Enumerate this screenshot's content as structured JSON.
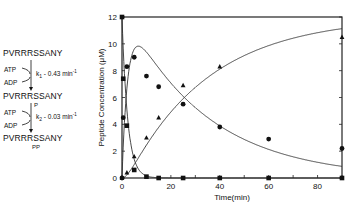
{
  "scheme": {
    "species": [
      {
        "name": "PVRRRSSANY",
        "sub": ""
      },
      {
        "name": "PVRRRSSANY",
        "sub": "P"
      },
      {
        "name": "PVRRRSSANY",
        "sub": "PP"
      }
    ],
    "steps": [
      {
        "in": "ATP",
        "out": "ADP",
        "k": "k",
        "k_sub": "1",
        "rate": " - 0.43 min",
        "unit_sup": "-1"
      },
      {
        "in": "ATP",
        "out": "ADP",
        "k": "k",
        "k_sub": "2",
        "rate": " - 0.03 min",
        "unit_sup": "-1"
      }
    ]
  },
  "chart_data": {
    "type": "scatter",
    "title": "",
    "xlabel": "Time(min)",
    "ylabel": "Peptide Concentration (μM)",
    "xlim": [
      0,
      90
    ],
    "ylim": [
      0,
      12
    ],
    "xticks": [
      0,
      20,
      40,
      60,
      80
    ],
    "yticks": [
      0,
      2,
      4,
      6,
      8,
      10,
      12
    ],
    "grid": false,
    "legend": "none (species identified in reaction scheme at left)",
    "series": [
      {
        "name": "PVRRRSSANY",
        "marker": "square",
        "x": [
          0,
          0.5,
          2,
          5,
          10,
          15,
          25,
          40,
          60,
          90
        ],
        "y": [
          12,
          7.4,
          3.9,
          0.6,
          0.1,
          0,
          0,
          0,
          0,
          0
        ]
      },
      {
        "name": "PVRRRSSANY-P",
        "marker": "circle",
        "x": [
          0,
          0.5,
          2,
          5,
          10,
          15,
          25,
          40,
          60,
          90
        ],
        "y": [
          0,
          4.5,
          8.3,
          9.0,
          7.6,
          6.8,
          5.5,
          3.8,
          2.9,
          2.2
        ]
      },
      {
        "name": "PVRRRSSANY-PP",
        "marker": "triangle",
        "x": [
          0,
          2,
          5,
          10,
          15,
          25,
          40,
          90
        ],
        "y": [
          0,
          0.4,
          1.6,
          3.0,
          4.5,
          6.9,
          8.3,
          10.5
        ]
      }
    ],
    "fit_model": {
      "k1_per_min": 0.43,
      "k2_per_min": 0.03,
      "S0_uM": 12
    }
  }
}
